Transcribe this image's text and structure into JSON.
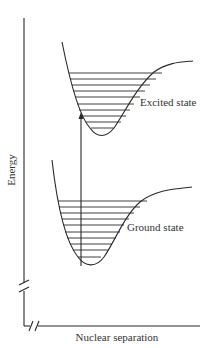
{
  "diagram": {
    "y_axis_label": "Energy",
    "x_axis_label": "Nuclear separation",
    "curves": [
      {
        "name": "excited",
        "label": "Excited state",
        "vibrational_levels": 10
      },
      {
        "name": "ground",
        "label": "Ground state",
        "vibrational_levels": 10
      }
    ],
    "transition": {
      "type": "vertical arrow",
      "from": "Ground state",
      "to": "Excited state"
    },
    "axis_breaks": [
      "y-axis",
      "x-axis"
    ],
    "colors": {
      "line": "#2a2a2a",
      "text": "#333333",
      "background": "#ffffff"
    }
  }
}
